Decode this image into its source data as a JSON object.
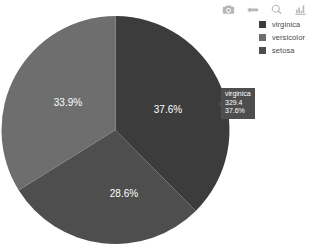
{
  "chart_data": {
    "type": "pie",
    "title": "",
    "categories": [
      "virginica",
      "versicolor",
      "setosa"
    ],
    "values": [
      37.6,
      28.6,
      33.9
    ],
    "labels": [
      "37.6%",
      "28.6%",
      "33.9%"
    ],
    "colors": [
      "#3c3c3c",
      "#4e4e4e",
      "#6e6e6e"
    ],
    "legend_position": "top-right",
    "grid": false,
    "hole": 0,
    "rotation_deg": 0,
    "direction": "clockwise",
    "hovered_slice": "virginica",
    "hovered_value": "329.4",
    "hovered_percent": "37.6%"
  },
  "legend": {
    "items": [
      {
        "label": "virginica",
        "color": "#3c3c3c"
      },
      {
        "label": "versicolor",
        "color": "#6e6e6e"
      },
      {
        "label": "setosa",
        "color": "#4e4e4e"
      }
    ]
  },
  "modebar": {
    "buttons": [
      {
        "name": "camera-icon",
        "title": "Download plot as a png"
      },
      {
        "name": "pan-icon",
        "title": "Pan"
      },
      {
        "name": "zoom-icon",
        "title": "Zoom"
      },
      {
        "name": "bar-chart-icon",
        "title": "Toggle chart type"
      }
    ]
  },
  "tooltip": {
    "title": "virginica",
    "value": "329.4",
    "percent": "37.6%"
  },
  "slices": [
    {
      "name": "virginica",
      "percent_label": "37.6%",
      "cx": 168,
      "cy": 110
    },
    {
      "name": "versicolor",
      "percent_label": "28.6%",
      "cx": 124,
      "cy": 194
    },
    {
      "name": "setosa",
      "percent_label": "33.9%",
      "cx": 68,
      "cy": 103
    }
  ]
}
